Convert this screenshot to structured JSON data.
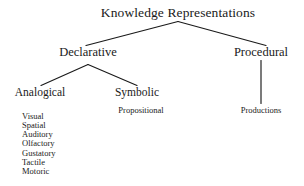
{
  "diagram": {
    "title": "Knowledge Representations",
    "background_color": "#ffffff",
    "line_color": "#1a1a1a",
    "text_color": "#1a1a1a",
    "nodes": {
      "root": "Knowledge Representations",
      "declarative": "Declarative",
      "procedural": "Procedural",
      "analogical": "Analogical",
      "symbolic": "Symbolic",
      "propositional": "Propositional",
      "productions": "Productions"
    },
    "analogical_modalities": [
      "Visual",
      "Spatial",
      "Auditory",
      "Olfactory",
      "Gustatory",
      "Tactile",
      "Motoric"
    ]
  }
}
